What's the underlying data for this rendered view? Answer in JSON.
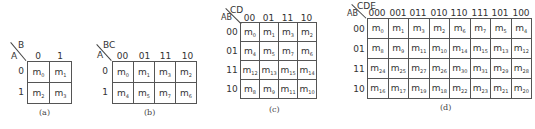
{
  "maps": [
    {
      "id": "a",
      "caption": "(a)",
      "row_var": "A",
      "col_var": "B",
      "col_labels": [
        "0",
        "1"
      ],
      "row_labels": [
        "0",
        "1"
      ],
      "cells": [
        [
          {
            "base": "m",
            "sub": "0"
          },
          {
            "base": "m",
            "sub": "1"
          }
        ],
        [
          {
            "base": "m",
            "sub": "2"
          },
          {
            "base": "m",
            "sub": "3"
          }
        ]
      ]
    },
    {
      "id": "b",
      "caption": "(b)",
      "row_var": "A",
      "col_var": "BC",
      "col_labels": [
        "00",
        "01",
        "11",
        "10"
      ],
      "row_labels": [
        "0",
        "1"
      ],
      "cells": [
        [
          {
            "base": "m",
            "sub": "0"
          },
          {
            "base": "m",
            "sub": "1"
          },
          {
            "base": "m",
            "sub": "3"
          },
          {
            "base": "m",
            "sub": "2"
          }
        ],
        [
          {
            "base": "m",
            "sub": "4"
          },
          {
            "base": "m",
            "sub": "5"
          },
          {
            "base": "m",
            "sub": "7"
          },
          {
            "base": "m",
            "sub": "6"
          }
        ]
      ]
    },
    {
      "id": "c",
      "caption": "(c)",
      "row_var": "AB",
      "col_var": "CD",
      "col_labels": [
        "00",
        "01",
        "11",
        "10"
      ],
      "row_labels": [
        "00",
        "01",
        "11",
        "10"
      ],
      "cells": [
        [
          {
            "base": "m",
            "sub": "0"
          },
          {
            "base": "m",
            "sub": "1"
          },
          {
            "base": "m",
            "sub": "3"
          },
          {
            "base": "m",
            "sub": "2"
          }
        ],
        [
          {
            "base": "m",
            "sub": "4"
          },
          {
            "base": "m",
            "sub": "5"
          },
          {
            "base": "m",
            "sub": "7"
          },
          {
            "base": "m",
            "sub": "6"
          }
        ],
        [
          {
            "base": "m",
            "sub": "12"
          },
          {
            "base": "m",
            "sub": "13"
          },
          {
            "base": "m",
            "sub": "15"
          },
          {
            "base": "m",
            "sub": "14"
          }
        ],
        [
          {
            "base": "m",
            "sub": "8"
          },
          {
            "base": "m",
            "sub": "9"
          },
          {
            "base": "m",
            "sub": "11"
          },
          {
            "base": "m",
            "sub": "10"
          }
        ]
      ]
    },
    {
      "id": "d",
      "caption": "(d)",
      "row_var": "AB",
      "col_var": "CDE",
      "col_labels": [
        "000",
        "001",
        "011",
        "010",
        "110",
        "111",
        "101",
        "100"
      ],
      "row_labels": [
        "00",
        "01",
        "11",
        "10"
      ],
      "cells": [
        [
          {
            "base": "m",
            "sub": "0"
          },
          {
            "base": "m",
            "sub": "1"
          },
          {
            "base": "m",
            "sub": "3"
          },
          {
            "base": "m",
            "sub": "2"
          },
          {
            "base": "m",
            "sub": "6"
          },
          {
            "base": "m",
            "sub": "7"
          },
          {
            "base": "m",
            "sub": "5"
          },
          {
            "base": "m",
            "sub": "4"
          }
        ],
        [
          {
            "base": "m",
            "sub": "8"
          },
          {
            "base": "m",
            "sub": "9"
          },
          {
            "base": "m",
            "sub": "11"
          },
          {
            "base": "m",
            "sub": "10"
          },
          {
            "base": "m",
            "sub": "14"
          },
          {
            "base": "m",
            "sub": "15"
          },
          {
            "base": "m",
            "sub": "13"
          },
          {
            "base": "m",
            "sub": "12"
          }
        ],
        [
          {
            "base": "m",
            "sub": "24"
          },
          {
            "base": "m",
            "sub": "25"
          },
          {
            "base": "m",
            "sub": "27"
          },
          {
            "base": "m",
            "sub": "26"
          },
          {
            "base": "m",
            "sub": "30"
          },
          {
            "base": "m",
            "sub": "31"
          },
          {
            "base": "m",
            "sub": "29"
          },
          {
            "base": "m",
            "sub": "28"
          }
        ],
        [
          {
            "base": "m",
            "sub": "16"
          },
          {
            "base": "m",
            "sub": "17"
          },
          {
            "base": "m",
            "sub": "19"
          },
          {
            "base": "m",
            "sub": "18"
          },
          {
            "base": "m",
            "sub": "22"
          },
          {
            "base": "m",
            "sub": "23"
          },
          {
            "base": "m",
            "sub": "21"
          },
          {
            "base": "m",
            "sub": "20"
          }
        ]
      ]
    }
  ]
}
